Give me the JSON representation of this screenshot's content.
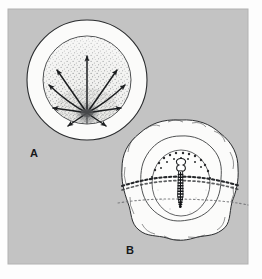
{
  "figure": {
    "background_color": "#c3c3c3",
    "page_color": "#fdfdfd",
    "ink_color": "#1c1e20",
    "fill_color": "#fbfbfa",
    "stipple_color": "#6f7174",
    "frame": {
      "x": 8,
      "y": 9,
      "width": 240,
      "height": 255
    }
  },
  "panels": [
    {
      "id": "A",
      "label": "A",
      "label_position": {
        "x": 30,
        "y": 157
      },
      "name": "panel-a-radiating-arrows",
      "description": "Concentric circles with a stippled inner disc and arrows radiating from a focal point near the lower centre",
      "outer_circle": {
        "cx": 87,
        "cy": 80,
        "r": 60,
        "fill": "#fbfbfa"
      },
      "inner_circle": {
        "cx": 87,
        "cy": 80,
        "r": 44,
        "fill": "#e9e9e7"
      },
      "focus_point": {
        "x": 87,
        "y": 114
      },
      "arrow_count": 9,
      "arrows": [
        {
          "name": "arrow-up",
          "angle_deg": 270,
          "length": 58
        },
        {
          "name": "arrow-upper-left",
          "angle_deg": 232,
          "length": 48
        },
        {
          "name": "arrow-upper-right",
          "angle_deg": 308,
          "length": 48
        },
        {
          "name": "arrow-left-upper",
          "angle_deg": 208,
          "length": 44
        },
        {
          "name": "arrow-right-upper",
          "angle_deg": 332,
          "length": 44
        },
        {
          "name": "arrow-left",
          "angle_deg": 186,
          "length": 34
        },
        {
          "name": "arrow-right",
          "angle_deg": 354,
          "length": 34
        },
        {
          "name": "arrow-lower-left",
          "angle_deg": 152,
          "length": 22
        },
        {
          "name": "arrow-lower-right",
          "angle_deg": 28,
          "length": 22
        }
      ]
    },
    {
      "id": "B",
      "label": "B",
      "label_position": {
        "x": 126,
        "y": 254
      },
      "name": "panel-b-scalloped-blob",
      "description": "Scalloped outer body enclosing a dotted inner oval with a central elongated segmented structure, crossed by two dotted horizontal bands",
      "outer_blob": {
        "cx": 180,
        "cy": 180,
        "rx": 57,
        "ry": 60,
        "lobes": 14,
        "fill": "#fbfbfa"
      },
      "middle_blob": {
        "cx": 180,
        "cy": 178,
        "rx": 40,
        "ry": 40,
        "lobes": 13,
        "fill": "#fcfcfb"
      },
      "inner_oval": {
        "cx": 181,
        "cy": 183,
        "rx": 29,
        "ry": 33,
        "fill": "#fdfdfc"
      },
      "dotted_bands": [
        {
          "name": "dotted-band-upper",
          "y": 181,
          "weight": "bold"
        },
        {
          "name": "dotted-band-lower",
          "y": 196,
          "weight": "faint"
        }
      ],
      "central_structure": {
        "name": "central-elongated-body",
        "head": {
          "cx": 181,
          "cy": 164,
          "r": 4
        },
        "tail_top_y": 169,
        "tail_bottom_y": 207,
        "segments": 13
      }
    }
  ]
}
